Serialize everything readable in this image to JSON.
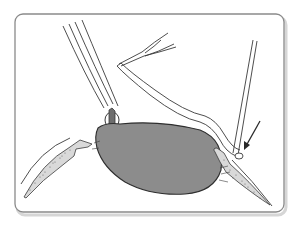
{
  "figure": {
    "type": "surgical-illustration",
    "colors": {
      "background": "#ffffff",
      "frame_border": "#8a8a8a",
      "frame_shadow": "#cfcfcf",
      "line": "#3a3a3a",
      "mass_fill": "#8c8c8c",
      "tissue_stipple": "#6a6a6a"
    },
    "elements": [
      {
        "name": "rounded-frame"
      },
      {
        "name": "forceps-left"
      },
      {
        "name": "bent-instrument-with-fork"
      },
      {
        "name": "cannula-right"
      },
      {
        "name": "lens-nucleus-mass"
      },
      {
        "name": "left-tissue-wedge"
      },
      {
        "name": "right-tissue-wedge"
      },
      {
        "name": "arrow-indicator"
      }
    ]
  }
}
